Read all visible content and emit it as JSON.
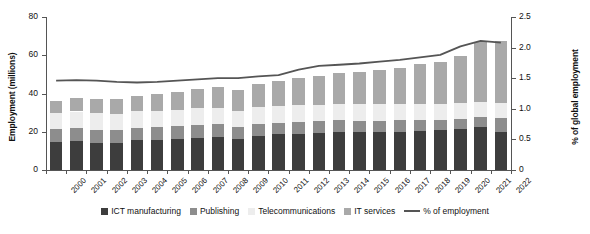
{
  "chart_data": {
    "type": "bar",
    "title": "",
    "subtitle": "",
    "xlabel": "",
    "ylabel": "Employment (millions)",
    "y2label": "% of global employment",
    "ylim": [
      0,
      80
    ],
    "y2lim": [
      0,
      2.5
    ],
    "yticks": [
      "0",
      "20",
      "40",
      "60",
      "80"
    ],
    "ytick_values": [
      0,
      20,
      40,
      60,
      80
    ],
    "y2ticks": [
      "0",
      "0.5",
      "1.0",
      "1.5",
      "2.0",
      "2.5"
    ],
    "y2tick_values": [
      0,
      0.5,
      1.0,
      1.5,
      2.0,
      2.5
    ],
    "grid": false,
    "stacked": true,
    "legend_position": "bottom",
    "categories": [
      "2000",
      "2001",
      "2002",
      "2003",
      "2004",
      "2005",
      "2006",
      "2007",
      "2008",
      "2009",
      "2010",
      "2011",
      "2012",
      "2013",
      "2014",
      "2015",
      "2016",
      "2017",
      "2018",
      "2019",
      "2020",
      "2021",
      "2022"
    ],
    "series": [
      {
        "name": "ICT manufacturing",
        "color": "#3d3d3d",
        "axis": "left",
        "values": [
          14.5,
          15.0,
          14.3,
          14.3,
          15.5,
          15.8,
          16.4,
          17.0,
          17.4,
          16.3,
          18.0,
          18.6,
          19.0,
          19.3,
          19.8,
          19.8,
          19.8,
          20.1,
          20.6,
          20.8,
          21.4,
          22.4,
          20.0
        ]
      },
      {
        "name": "Publishing",
        "color": "#8d8d8d",
        "axis": "left",
        "values": [
          7.0,
          7.0,
          6.7,
          6.6,
          6.6,
          6.5,
          6.5,
          6.5,
          6.5,
          6.2,
          6.2,
          6.2,
          6.2,
          6.1,
          6.1,
          6.0,
          5.9,
          5.8,
          5.7,
          5.6,
          5.4,
          5.2,
          7.0
        ]
      },
      {
        "name": "Telecommunications",
        "color": "#ededed",
        "axis": "left",
        "values": [
          8.5,
          8.6,
          8.7,
          8.6,
          8.5,
          8.5,
          8.6,
          8.7,
          8.7,
          8.6,
          8.7,
          8.7,
          8.7,
          8.7,
          8.7,
          8.7,
          8.6,
          8.5,
          8.4,
          8.3,
          8.2,
          8.0,
          8.0
        ]
      },
      {
        "name": "IT services",
        "color": "#a9a9a9",
        "axis": "left",
        "values": [
          6.2,
          7.2,
          7.3,
          7.8,
          8.3,
          8.8,
          9.4,
          10.2,
          10.8,
          11.0,
          12.2,
          13.2,
          14.2,
          15.0,
          16.0,
          17.0,
          18.0,
          19.2,
          20.5,
          22.0,
          24.5,
          31.4,
          32.6
        ]
      }
    ],
    "line_series": {
      "name": "% of employment",
      "color": "#555555",
      "axis": "right",
      "values": [
        1.46,
        1.47,
        1.46,
        1.44,
        1.43,
        1.44,
        1.46,
        1.48,
        1.5,
        1.5,
        1.53,
        1.55,
        1.64,
        1.7,
        1.72,
        1.74,
        1.77,
        1.8,
        1.84,
        1.88,
        2.02,
        2.11,
        2.08
      ]
    },
    "legend": [
      {
        "label": "ICT manufacturing",
        "marker": "swatch",
        "swatch_class": "ict"
      },
      {
        "label": "Publishing",
        "marker": "swatch",
        "swatch_class": "pub"
      },
      {
        "label": "Telecommunications",
        "marker": "swatch",
        "swatch_class": "tel"
      },
      {
        "label": "IT services",
        "marker": "swatch",
        "swatch_class": "its"
      },
      {
        "label": "% of employment",
        "marker": "line",
        "swatch_class": "line"
      }
    ]
  }
}
